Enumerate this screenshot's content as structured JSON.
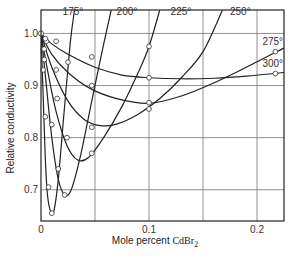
{
  "chart_data": {
    "type": "line",
    "title": "",
    "xlabel": "Mole percent CdBr2",
    "xlabel_main": "Mole percent ",
    "xlabel_formula": "CdBr",
    "xlabel_subscript": "2",
    "ylabel": "Relative conductivity",
    "xlim": [
      0,
      0.225
    ],
    "ylim": [
      0.64,
      1.045
    ],
    "xticks": [
      0,
      0.1,
      0.2
    ],
    "xtick_labels": [
      "0",
      "0.1",
      "0.2"
    ],
    "x_gridlines": [
      0.05,
      0.1,
      0.15,
      0.2
    ],
    "yticks": [
      0.7,
      0.8,
      0.9,
      1.0
    ],
    "ytick_labels": [
      "0.7",
      "0.8",
      "0.9",
      "1.0"
    ],
    "grid": true,
    "legend": "none (curves labeled inline at top)",
    "series": [
      {
        "name": "175°",
        "label": "175°",
        "curve": [
          [
            0,
            1.0
          ],
          [
            0.002,
            0.88
          ],
          [
            0.004,
            0.76
          ],
          [
            0.006,
            0.69
          ],
          [
            0.009,
            0.658
          ],
          [
            0.012,
            0.66
          ],
          [
            0.016,
            0.72
          ],
          [
            0.021,
            0.84
          ],
          [
            0.027,
            0.98
          ],
          [
            0.031,
            1.045
          ]
        ],
        "points": [
          [
            0.002,
            0.93
          ],
          [
            0.004,
            0.84
          ],
          [
            0.007,
            0.705
          ],
          [
            0.01,
            0.655
          ]
        ]
      },
      {
        "name": "200°",
        "label": "200°",
        "curve": [
          [
            0,
            1.0
          ],
          [
            0.004,
            0.92
          ],
          [
            0.01,
            0.8
          ],
          [
            0.016,
            0.72
          ],
          [
            0.022,
            0.69
          ],
          [
            0.028,
            0.7
          ],
          [
            0.036,
            0.76
          ],
          [
            0.046,
            0.86
          ],
          [
            0.056,
            0.96
          ],
          [
            0.065,
            1.045
          ]
        ],
        "points": [
          [
            0.003,
            0.95
          ],
          [
            0.01,
            0.825
          ],
          [
            0.016,
            0.74
          ],
          [
            0.022,
            0.69
          ]
        ]
      },
      {
        "name": "225°",
        "label": "225°",
        "curve": [
          [
            0,
            1.0
          ],
          [
            0.006,
            0.93
          ],
          [
            0.014,
            0.85
          ],
          [
            0.024,
            0.785
          ],
          [
            0.034,
            0.757
          ],
          [
            0.044,
            0.762
          ],
          [
            0.058,
            0.8
          ],
          [
            0.075,
            0.86
          ],
          [
            0.09,
            0.925
          ],
          [
            0.1,
            0.975
          ],
          [
            0.11,
            1.045
          ]
        ],
        "points": [
          [
            0.002,
            0.97
          ],
          [
            0.015,
            0.875
          ],
          [
            0.024,
            0.8
          ],
          [
            0.047,
            0.77
          ],
          [
            0.1,
            0.975
          ]
        ]
      },
      {
        "name": "250°",
        "label": "250°",
        "curve": [
          [
            0,
            1.0
          ],
          [
            0.01,
            0.935
          ],
          [
            0.025,
            0.87
          ],
          [
            0.04,
            0.835
          ],
          [
            0.055,
            0.823
          ],
          [
            0.07,
            0.826
          ],
          [
            0.09,
            0.845
          ],
          [
            0.11,
            0.875
          ],
          [
            0.13,
            0.915
          ],
          [
            0.15,
            0.965
          ],
          [
            0.168,
            1.045
          ]
        ],
        "points": [
          [
            0.003,
            0.97
          ],
          [
            0.014,
            0.93
          ],
          [
            0.047,
            0.82
          ],
          [
            0.1,
            0.855
          ]
        ]
      },
      {
        "name": "275°",
        "label": "275°",
        "curve": [
          [
            0,
            1.0
          ],
          [
            0.01,
            0.96
          ],
          [
            0.025,
            0.925
          ],
          [
            0.045,
            0.895
          ],
          [
            0.07,
            0.875
          ],
          [
            0.1,
            0.866
          ],
          [
            0.13,
            0.88
          ],
          [
            0.16,
            0.905
          ],
          [
            0.19,
            0.935
          ],
          [
            0.225,
            0.972
          ]
        ],
        "points": [
          [
            0.005,
            0.985
          ],
          [
            0.025,
            0.945
          ],
          [
            0.047,
            0.9
          ],
          [
            0.1,
            0.867
          ],
          [
            0.217,
            0.965
          ]
        ]
      },
      {
        "name": "300°",
        "label": "300°",
        "curve": [
          [
            0,
            1.0
          ],
          [
            0.01,
            0.98
          ],
          [
            0.025,
            0.96
          ],
          [
            0.05,
            0.935
          ],
          [
            0.075,
            0.92
          ],
          [
            0.1,
            0.915
          ],
          [
            0.13,
            0.913
          ],
          [
            0.16,
            0.914
          ],
          [
            0.19,
            0.918
          ],
          [
            0.225,
            0.925
          ]
        ],
        "points": [
          [
            0.004,
            0.99
          ],
          [
            0.014,
            0.985
          ],
          [
            0.047,
            0.955
          ],
          [
            0.1,
            0.915
          ],
          [
            0.217,
            0.923
          ]
        ]
      }
    ],
    "series_labels_pos": [
      {
        "label": "175°",
        "x": 0.02,
        "y": 1.035
      },
      {
        "label": "200°",
        "x": 0.07,
        "y": 1.035
      },
      {
        "label": "225°",
        "x": 0.12,
        "y": 1.035
      },
      {
        "label": "250°",
        "x": 0.175,
        "y": 1.035
      },
      {
        "label": "275°",
        "x": 0.205,
        "y": 0.978
      },
      {
        "label": "300°",
        "x": 0.205,
        "y": 0.935
      }
    ]
  }
}
